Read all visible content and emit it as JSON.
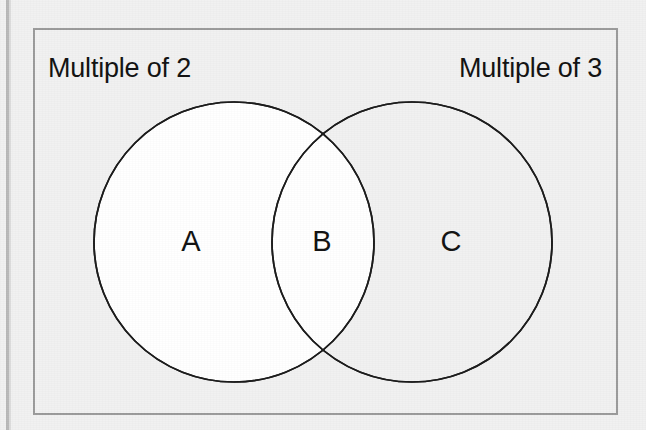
{
  "diagram": {
    "type": "venn-2-set",
    "background_color": "#f1f1f1",
    "frame_border_color": "#9a9a9a",
    "circle_stroke_color": "#1a1a1a",
    "circle_fill_color": "#ffffff",
    "text_color": "#111111"
  },
  "labels": {
    "left_set": "Multiple of 2",
    "right_set": "Multiple of 3"
  },
  "regions": [
    {
      "key": "a",
      "letter": "A",
      "meaning": "Multiple of 2 only"
    },
    {
      "key": "b",
      "letter": "B",
      "meaning": "Multiple of 2 and multiple of 3"
    },
    {
      "key": "c",
      "letter": "C",
      "meaning": "Multiple of 3 only"
    }
  ],
  "circles": {
    "left": {
      "cx": 234,
      "cy": 242,
      "r": 140
    },
    "right": {
      "cx": 412,
      "cy": 242,
      "r": 140
    }
  }
}
